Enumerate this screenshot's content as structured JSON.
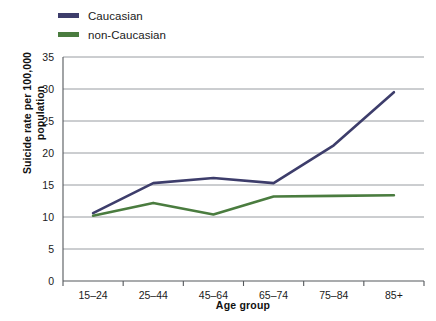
{
  "chart_data": {
    "type": "line",
    "title": "",
    "xlabel": "Age group",
    "ylabel": "Suicide rate per 100,000 population",
    "categories": [
      "15–24",
      "25–44",
      "45–64",
      "65–74",
      "75–84",
      "85+"
    ],
    "series": [
      {
        "name": "Caucasian",
        "color": "#3d3d6b",
        "values": [
          10.6,
          15.3,
          16.1,
          15.3,
          21.2,
          29.5
        ]
      },
      {
        "name": "non-Caucasian",
        "color": "#4a7c3f",
        "values": [
          10.2,
          12.2,
          10.4,
          13.2,
          13.3,
          13.4
        ]
      }
    ],
    "ylim": [
      0,
      35
    ],
    "yticks": [
      0,
      5,
      10,
      15,
      20,
      25,
      30,
      35
    ],
    "ytick_labels": [
      "0",
      "5",
      "10",
      "15",
      "20",
      "25",
      "30",
      "35"
    ],
    "grid": "horizontal",
    "legend_position": "top-left"
  },
  "legend": {
    "entries": [
      {
        "label": "Caucasian"
      },
      {
        "label": "non-Caucasian"
      }
    ]
  },
  "axes": {
    "y_title": "Suicide rate per 100,000 population",
    "x_title": "Age group"
  }
}
